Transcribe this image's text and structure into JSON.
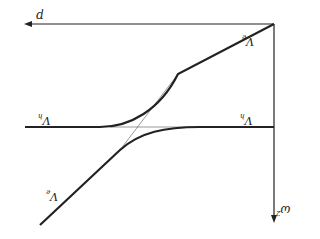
{
  "figure": {
    "orientation": "rotated 180 degrees",
    "colors": {
      "stroke": "#222222",
      "thin": "#555555",
      "background": "#ffffff"
    },
    "axes": {
      "horizontal": {
        "label": "p"
      },
      "vertical": {
        "label": "ω",
        "label_sup": "2"
      }
    },
    "curves": [
      {
        "name": "V_h",
        "label": "V",
        "label_sub": "h",
        "kind": "flat dispersion"
      },
      {
        "name": "V_e",
        "label": "V",
        "label_sub": "e",
        "kind": "linear dispersion"
      }
    ],
    "labels": {
      "ve_upper": {
        "main": "V",
        "sub": "e"
      },
      "ve_lower": {
        "main": "V",
        "sub": "e"
      },
      "vh_left": {
        "main": "V",
        "sub": "h"
      },
      "vh_right": {
        "main": "V",
        "sub": "h"
      },
      "p_axis": {
        "main": "p"
      },
      "omega_axis": {
        "main": "ω",
        "sup": "2"
      }
    }
  }
}
